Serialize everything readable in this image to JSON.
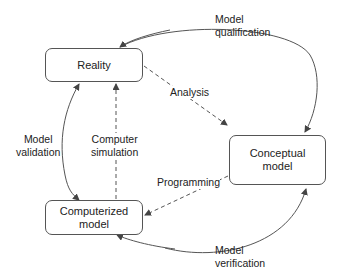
{
  "nodes": {
    "reality": "Reality",
    "conceptual": [
      "Conceptual",
      "model"
    ],
    "computerized": [
      "Computerized",
      "model"
    ]
  },
  "edges": {
    "model_qualification": [
      "Model",
      "qualification"
    ],
    "model_validation": [
      "Model",
      "validation"
    ],
    "model_verification": [
      "Model",
      "verification"
    ],
    "analysis": "Analysis",
    "programming": "Programming",
    "computer_simulation": [
      "Computer",
      "simulation"
    ]
  },
  "colors": {
    "stroke": "#555555",
    "text": "#222222",
    "background": "#ffffff"
  }
}
